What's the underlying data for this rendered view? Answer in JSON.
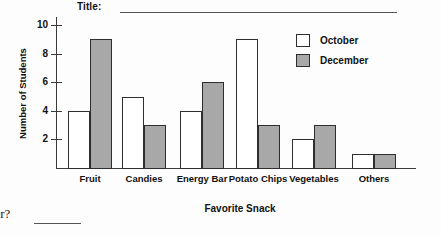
{
  "worksheet": {
    "title_prompt": "Title:",
    "title_value": "",
    "question_fragment": "ber?",
    "answer_blank": ""
  },
  "legend": {
    "position": "top-right",
    "items": [
      {
        "label": "October",
        "swatch": "white-square-icon",
        "color": "#ffffff"
      },
      {
        "label": "December",
        "swatch": "gray-square-icon",
        "color": "#a8a8a8"
      }
    ]
  },
  "chart_data": {
    "type": "bar",
    "title": "",
    "xlabel": "Favorite Snack",
    "ylabel": "Number of Students",
    "categories": [
      "Fruit",
      "Candies",
      "Energy Bar",
      "Potato Chips",
      "Vegetables",
      "Others"
    ],
    "series": [
      {
        "name": "October",
        "values": [
          4,
          5,
          4,
          9,
          2,
          1
        ],
        "color": "#ffffff"
      },
      {
        "name": "December",
        "values": [
          9,
          3,
          6,
          3,
          3,
          1
        ],
        "color": "#a8a8a8"
      }
    ],
    "ylim": [
      0,
      10
    ],
    "yticks": [
      2,
      4,
      6,
      8,
      10
    ],
    "ytick_labels": [
      "2",
      "4",
      "6",
      "8",
      "10"
    ],
    "grid": false,
    "legend_position": "top-right"
  }
}
